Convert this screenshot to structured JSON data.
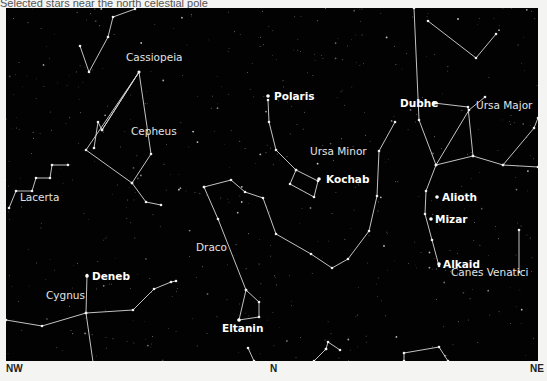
{
  "header": {
    "caption_partial": "Selected stars near the north celestial pole"
  },
  "chart": {
    "background": "#020202",
    "line_color": "#d8d8d8",
    "constellations": [
      {
        "name": "Cassiopeia",
        "label_x": 120,
        "label_y": 53,
        "lines": [
          [
            [
              74,
              38
            ],
            [
              83,
              64
            ],
            [
              102,
              29
            ],
            [
              107,
              9
            ],
            [
              129,
              1
            ]
          ]
        ]
      },
      {
        "name": "Cepheus",
        "label_x": 125,
        "label_y": 127,
        "lines": [
          [
            [
              133,
              64
            ],
            [
              96,
              122
            ],
            [
              92,
              114
            ],
            [
              88,
              140
            ]
          ],
          [
            [
              96,
              122
            ],
            [
              133,
              64
            ],
            [
              80,
              142
            ],
            [
              126,
              175
            ],
            [
              145,
              146
            ],
            [
              133,
              64
            ]
          ],
          [
            [
              126,
              175
            ],
            [
              140,
              194
            ],
            [
              155,
              197
            ]
          ]
        ]
      },
      {
        "name": "Lacerta",
        "label_x": 14,
        "label_y": 193,
        "lines": [
          [
            [
              3,
              200
            ],
            [
              10,
              183
            ],
            [
              26,
              183
            ],
            [
              30,
              170
            ],
            [
              44,
              170
            ],
            [
              46,
              157
            ],
            [
              62,
              157
            ]
          ]
        ]
      },
      {
        "name": "Cygnus",
        "label_x": 40,
        "label_y": 291,
        "lines": [
          [
            [
              81,
              267
            ],
            [
              80,
              305
            ],
            [
              88,
              361
            ]
          ],
          [
            [
              0,
              312
            ],
            [
              36,
              318
            ],
            [
              80,
              305
            ],
            [
              127,
              302
            ],
            [
              148,
              281
            ],
            [
              165,
              274
            ],
            [
              170,
              273
            ]
          ]
        ]
      },
      {
        "name": "Draco",
        "label_x": 190,
        "label_y": 243,
        "lines": [
          [
            [
              198,
              179
            ],
            [
              225,
              172
            ],
            [
              239,
              184
            ],
            [
              257,
              190
            ],
            [
              270,
              226
            ],
            [
              305,
              246
            ],
            [
              326,
              260
            ],
            [
              342,
              251
            ],
            [
              363,
              223
            ],
            [
              371,
              188
            ],
            [
              373,
              143
            ],
            [
              389,
              114
            ]
          ],
          [
            [
              198,
              179
            ],
            [
              212,
              211
            ],
            [
              240,
              282
            ],
            [
              253,
              294
            ],
            [
              253,
              309
            ],
            [
              233,
              312
            ],
            [
              240,
              282
            ]
          ]
        ]
      },
      {
        "name": "Ursa Minor",
        "label_x": 304,
        "label_y": 147,
        "lines": [
          [
            [
              262,
              92
            ],
            [
              263,
              114
            ],
            [
              270,
              142
            ],
            [
              290,
              162
            ],
            [
              312,
              173
            ],
            [
              308,
              189
            ],
            [
              284,
              176
            ],
            [
              290,
              162
            ]
          ]
        ]
      },
      {
        "name": "Ursa Major",
        "label_x": 470,
        "label_y": 101,
        "lines": [
          [
            [
              428,
              95
            ],
            [
              462,
              99
            ],
            [
              467,
              148
            ],
            [
              430,
              157
            ],
            [
              413,
              112
            ],
            [
              408,
              0
            ]
          ],
          [
            [
              467,
              148
            ],
            [
              497,
              157
            ],
            [
              532,
              159
            ]
          ],
          [
            [
              497,
              157
            ],
            [
              528,
              120
            ],
            [
              532,
              110
            ]
          ],
          [
            [
              430,
              157
            ],
            [
              420,
              183
            ],
            [
              419,
              206
            ],
            [
              426,
              232
            ],
            [
              433,
              258
            ]
          ],
          [
            [
              430,
              157
            ],
            [
              463,
              102
            ],
            [
              479,
              89
            ]
          ],
          [
            [
              422,
              13
            ],
            [
              470,
              50
            ],
            [
              490,
              26
            ]
          ]
        ]
      },
      {
        "name": "Canes Venatici",
        "label_x": 445,
        "label_y": 268,
        "lines": [
          [
            [
              513,
              222
            ],
            [
              513,
              264
            ]
          ]
        ]
      },
      {
        "name": "Lower unnamed 1",
        "label_x": null,
        "label_y": null,
        "lines": [
          [
            [
              248,
              353
            ],
            [
              242,
              340
            ]
          ],
          [
            [
              320,
              341
            ],
            [
              322,
              334
            ],
            [
              334,
              342
            ]
          ],
          [
            [
              308,
              353
            ],
            [
              320,
              341
            ]
          ],
          [
            [
              398,
              353
            ],
            [
              398,
              345
            ],
            [
              433,
              339
            ],
            [
              442,
              353
            ]
          ]
        ]
      }
    ],
    "labeled_stars": [
      {
        "name": "Polaris",
        "x": 262,
        "y": 88,
        "tx": 268,
        "ty": 92
      },
      {
        "name": "Kochab",
        "x": 313,
        "y": 171,
        "tx": 320,
        "ty": 175
      },
      {
        "name": "Dubhe",
        "x": 428,
        "y": 95,
        "tx": 394,
        "ty": 99
      },
      {
        "name": "Alioth",
        "x": 431,
        "y": 189,
        "tx": 436,
        "ty": 193
      },
      {
        "name": "Mizar",
        "x": 425,
        "y": 211,
        "tx": 429,
        "ty": 215
      },
      {
        "name": "Alkaid",
        "x": 433,
        "y": 256,
        "tx": 437,
        "ty": 260
      },
      {
        "name": "Deneb",
        "x": 81,
        "y": 268,
        "tx": 86,
        "ty": 272
      },
      {
        "name": "Eltanin",
        "x": 233,
        "y": 312,
        "tx": 216,
        "ty": 324
      }
    ]
  },
  "compass": {
    "left": "NW",
    "center": "N",
    "right": "NE"
  }
}
